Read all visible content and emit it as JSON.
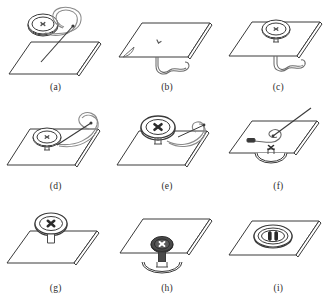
{
  "figure": {
    "background_color": "#ffffff",
    "ink_color": "#3a3a3a",
    "fabric_fill": "#ffffff",
    "button_dark_fill": "#4a4a4a",
    "columns": 3,
    "rows": 3,
    "panels": [
      {
        "label": "(a)",
        "id": "panel-a",
        "caption_text": "(a)",
        "description": "Needle with threaded loop and button held above the flat fabric panel",
        "elements": [
          "fabric-sheet",
          "button-four-hole",
          "needle",
          "thread-loop"
        ]
      },
      {
        "label": "(b)",
        "id": "panel-b",
        "caption_text": "(b)",
        "description": "Fabric sheet with entry mark on top and knotted thread tail hanging below",
        "elements": [
          "fabric-sheet",
          "stitch-mark",
          "thread-tail",
          "corner-fold"
        ]
      },
      {
        "label": "(c)",
        "id": "panel-c",
        "caption_text": "(c)",
        "description": "Button seated on the fabric with thread passing through to the underside",
        "elements": [
          "fabric-sheet",
          "button-four-hole",
          "thread-stem",
          "thread-tail"
        ]
      },
      {
        "label": "(d)",
        "id": "panel-d",
        "caption_text": "(d)",
        "description": "Needle drawn up through a button hole while thread loops to the right",
        "elements": [
          "fabric-sheet",
          "button-four-hole",
          "needle",
          "thread-loop",
          "thread-stem"
        ]
      },
      {
        "label": "(e)",
        "id": "panel-e",
        "caption_text": "(e)",
        "description": "Cross stitch completed across the button face, needle exiting to the right",
        "elements": [
          "fabric-sheet",
          "button-cross-stitch",
          "needle",
          "thread-loop",
          "thread-stem"
        ]
      },
      {
        "label": "(f)",
        "id": "panel-f",
        "caption_text": "(f)",
        "description": "Fabric turned over, button underneath, needle forming a finishing knot on top",
        "elements": [
          "fabric-sheet",
          "button-underside",
          "needle",
          "thread-knot-loop",
          "thread-tab"
        ]
      },
      {
        "label": "(g)",
        "id": "panel-g",
        "caption_text": "(g)",
        "description": "Finished button with cross stitch standing on a thread shank above the fabric",
        "elements": [
          "fabric-sheet",
          "button-cross-stitch",
          "thread-shank"
        ]
      },
      {
        "label": "(h)",
        "id": "panel-h",
        "caption_text": "(h)",
        "description": "Dark button on the face with a flat backing button secured beneath the fabric",
        "elements": [
          "fabric-sheet",
          "button-dark-cross",
          "thread-shank",
          "backing-button"
        ]
      },
      {
        "label": "(i)",
        "id": "panel-i",
        "caption_text": "(i)",
        "description": "Finished oval buttonhole with two reinforcing bar tacks in the fabric",
        "elements": [
          "fabric-sheet",
          "buttonhole-oval",
          "bar-tack-left",
          "bar-tack-right"
        ]
      }
    ]
  }
}
